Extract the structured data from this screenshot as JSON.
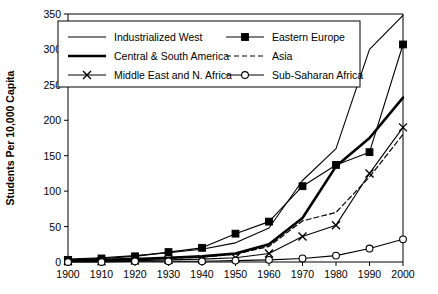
{
  "chart_data": {
    "type": "line",
    "title": "",
    "xlabel": "",
    "ylabel": "Students Per 10,000 Capita",
    "x": [
      1900,
      1910,
      1920,
      1930,
      1940,
      1950,
      1960,
      1970,
      1980,
      1990,
      2000
    ],
    "xlim": [
      1900,
      2000
    ],
    "ylim": [
      0,
      350
    ],
    "yticks": [
      0,
      50,
      100,
      150,
      200,
      250,
      300,
      350
    ],
    "xticks": [
      1900,
      1910,
      1920,
      1930,
      1940,
      1950,
      1960,
      1970,
      1980,
      1990,
      2000
    ],
    "grid": false,
    "legend_position": "top-inside",
    "series": [
      {
        "name": "Industrialized West",
        "style": "thin-solid",
        "marker": "none",
        "values": [
          4,
          6,
          9,
          13,
          18,
          27,
          48,
          115,
          160,
          300,
          348
        ]
      },
      {
        "name": "Central & South America",
        "style": "thick-solid",
        "marker": "none",
        "values": [
          2,
          3,
          4,
          6,
          8,
          12,
          25,
          62,
          135,
          175,
          232
        ]
      },
      {
        "name": "Middle East and N. Africa",
        "style": "thin-solid",
        "marker": "cross",
        "values": [
          1,
          1,
          2,
          3,
          4,
          6,
          12,
          36,
          52,
          125,
          190
        ]
      },
      {
        "name": "Eastern Europe",
        "style": "thin-solid",
        "marker": "square",
        "values": [
          3,
          5,
          8,
          14,
          20,
          40,
          57,
          107,
          137,
          155,
          307
        ]
      },
      {
        "name": "Asia",
        "style": "dashed",
        "marker": "none",
        "values": [
          1,
          2,
          3,
          5,
          7,
          11,
          22,
          58,
          70,
          120,
          180
        ]
      },
      {
        "name": "Sub-Saharan Africa",
        "style": "thin-solid",
        "marker": "circle",
        "values": [
          0,
          0,
          1,
          1,
          1,
          2,
          3,
          5,
          9,
          19,
          32
        ]
      }
    ]
  },
  "axis": {
    "y_title": "Students Per 10,000 Capita",
    "y_ticks": [
      "0",
      "50",
      "100",
      "150",
      "200",
      "250",
      "300",
      "350"
    ],
    "x_ticks": [
      "1900",
      "1910",
      "1920",
      "1930",
      "1940",
      "1950",
      "1960",
      "1970",
      "1980",
      "1990",
      "2000"
    ]
  },
  "legend": {
    "entries": [
      {
        "label": "Industrialized West",
        "style": "thin-solid",
        "marker": "none"
      },
      {
        "label": "Eastern Europe",
        "style": "thin-solid",
        "marker": "square"
      },
      {
        "label": "Central & South America",
        "style": "thick-solid",
        "marker": "none"
      },
      {
        "label": "Asia",
        "style": "dashed",
        "marker": "none"
      },
      {
        "label": "Middle East and N. Africa",
        "style": "thin-solid",
        "marker": "cross"
      },
      {
        "label": "Sub-Saharan Africa",
        "style": "thin-solid",
        "marker": "circle"
      }
    ]
  },
  "colors": {
    "line": "#000000",
    "background": "#ffffff",
    "text": "#000000"
  }
}
